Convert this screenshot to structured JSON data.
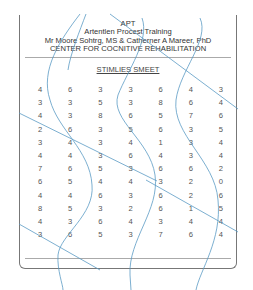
{
  "header": {
    "line1": "APT",
    "line2": "Artentlen Procest Tralning",
    "line3": "Mr Moore Sohtrg, MS & Catherner A Mareer, PhD",
    "line4": "CENTER FOR COCNITIVE REHABILITATION"
  },
  "subtitle": "STIMLIES SMEET",
  "grid": {
    "rows": [
      [
        "4",
        "6",
        "3",
        "3",
        "6",
        "4",
        "3"
      ],
      [
        "3",
        "3",
        "5",
        "3",
        "8",
        "6",
        "4"
      ],
      [
        "4",
        "3",
        "8",
        "6",
        "5",
        "7",
        "6"
      ],
      [
        "2",
        "6",
        "3",
        "5",
        "6",
        "3",
        "5"
      ],
      [
        "3",
        "4",
        "3",
        "4",
        "1",
        "3",
        "4"
      ],
      [
        "4",
        "4",
        "3",
        "6",
        "4",
        "3",
        "4"
      ],
      [
        "7",
        "6",
        "5",
        "3",
        "6",
        "6",
        "2"
      ],
      [
        "6",
        "5",
        "4",
        "4",
        "3",
        "2",
        "0"
      ],
      [
        "4",
        "4",
        "6",
        "3",
        "6",
        "2",
        "6"
      ],
      [
        "8",
        "5",
        "3",
        "2",
        "6",
        "1",
        "5"
      ],
      [
        "4",
        "3",
        "6",
        "4",
        "3",
        "4",
        "4"
      ],
      [
        "3",
        "6",
        "5",
        "3",
        "7",
        "6",
        "4"
      ]
    ]
  },
  "colors": {
    "overlay_lines": "#5b9ac4",
    "border": "#777777",
    "text": "#444444"
  }
}
